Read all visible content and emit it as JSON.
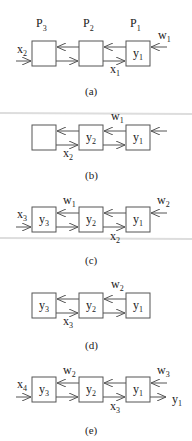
{
  "figure": {
    "processors": [
      "P3",
      "P2",
      "P1"
    ],
    "panels": [
      {
        "id": "a",
        "caption": "(a)",
        "boxes": [
          "",
          "",
          "y1"
        ],
        "labels": {
          "left_in": "x2",
          "mid_bottom": "x1",
          "right_in": "w1"
        }
      },
      {
        "id": "b",
        "caption": "(b)",
        "boxes": [
          "",
          "y2",
          "y1"
        ],
        "labels": {
          "left_bottom": "x2",
          "mid_top": "w1"
        }
      },
      {
        "id": "c",
        "caption": "(c)",
        "boxes": [
          "y3",
          "y2",
          "y1"
        ],
        "labels": {
          "left_in": "x3",
          "left_top": "w1",
          "mid_bottom": "x2",
          "right_in": "w2"
        }
      },
      {
        "id": "d",
        "caption": "(d)",
        "boxes": [
          "y3",
          "y2",
          "y1"
        ],
        "labels": {
          "left_bottom": "x3",
          "mid_top": "w2"
        }
      },
      {
        "id": "e",
        "caption": "(e)",
        "boxes": [
          "y3",
          "y2",
          "y1"
        ],
        "labels": {
          "left_in": "x4",
          "left_top": "w2",
          "mid_bottom": "x3",
          "right_in": "w3",
          "right_out": "y1"
        }
      }
    ]
  }
}
